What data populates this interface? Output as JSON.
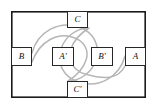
{
  "figure": {
    "type": "topological-diagram",
    "frame": {
      "x": 11,
      "y": 11,
      "width": 135,
      "height": 87,
      "stroke_color": "#1a1a1a"
    },
    "curve_color": "#b6b6b6",
    "box_border_color": "#272727",
    "box_fill_color": "#ffffff",
    "nodes": [
      {
        "id": "C",
        "label": "C",
        "x": 67,
        "y": 11,
        "width": 21,
        "height": 17,
        "position": "top-edge"
      },
      {
        "id": "B",
        "label": "B",
        "x": 11,
        "y": 47,
        "width": 21,
        "height": 19,
        "position": "left-edge"
      },
      {
        "id": "A2",
        "label": "A'",
        "x": 52,
        "y": 47,
        "width": 22,
        "height": 19,
        "position": "center-left"
      },
      {
        "id": "B2",
        "label": "B'",
        "x": 91,
        "y": 47,
        "width": 22,
        "height": 19,
        "position": "center-right"
      },
      {
        "id": "A",
        "label": "A",
        "x": 125,
        "y": 47,
        "width": 21,
        "height": 19,
        "position": "right-edge"
      },
      {
        "id": "C2",
        "label": "C'",
        "x": 67,
        "y": 81,
        "width": 21,
        "height": 17,
        "position": "bottom-edge"
      }
    ],
    "curves": [
      {
        "name": "curve-b-to-c-prime",
        "description": "S-shaped band starting at B on the left edge, looping clockwise around A', crossing the center diagonally, and descending to C' on the bottom edge",
        "outer": "M 32 53 C 38 30, 60 22, 75 26 C 96 31, 100 48, 96 60 C 92 73, 80 80, 70 81",
        "inner": "M 32 62 C 40 40, 58 33, 72 37 C 86 41, 89 52, 86 60 C 83 70, 76 76, 68 81"
      },
      {
        "name": "curve-a-to-c",
        "description": "S-shaped band starting at A on the right edge, looping counter-clockwise around B', crossing the center diagonally, and rising to C on the top edge",
        "outer": "M 125 56 C 119 79, 97 87, 82 83 C 61 78, 57 61, 61 49 C 65 36, 77 29, 87 28",
        "inner": "M 125 66 C 117 82, 99 78, 85 74 C 71 70, 68 57, 71 49 C 74 39, 81 33, 89 28"
      }
    ]
  }
}
